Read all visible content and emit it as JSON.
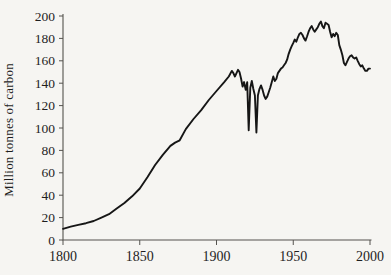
{
  "figure": {
    "background": "#f6f5f2",
    "axis_color": "#55534f",
    "line_color": "#161616",
    "text_color": "#1e1e1e"
  },
  "chart_data": {
    "type": "line",
    "title": "",
    "xlabel": "",
    "ylabel": "Million tonnes of carbon",
    "xlim": [
      1800,
      2000
    ],
    "ylim": [
      0,
      200
    ],
    "x_ticks": [
      "1800",
      "1850",
      "1900",
      "1950",
      "2000"
    ],
    "x_tick_values": [
      1800,
      1850,
      1900,
      1950,
      2000
    ],
    "y_ticks": [
      "0",
      "20",
      "40",
      "60",
      "80",
      "100",
      "120",
      "140",
      "160",
      "180",
      "200"
    ],
    "y_tick_values": [
      0,
      20,
      40,
      60,
      80,
      100,
      120,
      140,
      160,
      180,
      200
    ],
    "grid": false,
    "legend": null,
    "points": [
      [
        1800,
        10
      ],
      [
        1805,
        12
      ],
      [
        1810,
        13.5
      ],
      [
        1815,
        15
      ],
      [
        1820,
        17
      ],
      [
        1825,
        20
      ],
      [
        1830,
        23
      ],
      [
        1835,
        28
      ],
      [
        1840,
        33
      ],
      [
        1845,
        39
      ],
      [
        1850,
        46
      ],
      [
        1855,
        56
      ],
      [
        1860,
        67
      ],
      [
        1865,
        76
      ],
      [
        1870,
        84
      ],
      [
        1873,
        87
      ],
      [
        1876,
        89
      ],
      [
        1880,
        99
      ],
      [
        1885,
        108
      ],
      [
        1890,
        116
      ],
      [
        1895,
        125
      ],
      [
        1900,
        133
      ],
      [
        1905,
        141
      ],
      [
        1908,
        146
      ],
      [
        1910,
        151
      ],
      [
        1911,
        149
      ],
      [
        1912,
        146
      ],
      [
        1913,
        149
      ],
      [
        1914,
        152
      ],
      [
        1915,
        150
      ],
      [
        1916,
        144
      ],
      [
        1917,
        137
      ],
      [
        1918,
        141
      ],
      [
        1919,
        134
      ],
      [
        1920,
        141
      ],
      [
        1921,
        98
      ],
      [
        1922,
        136
      ],
      [
        1923,
        142
      ],
      [
        1924,
        135
      ],
      [
        1925,
        129
      ],
      [
        1926,
        96
      ],
      [
        1927,
        129
      ],
      [
        1928,
        135
      ],
      [
        1929,
        138
      ],
      [
        1930,
        134
      ],
      [
        1931,
        129
      ],
      [
        1932,
        126
      ],
      [
        1933,
        128
      ],
      [
        1934,
        132
      ],
      [
        1935,
        136
      ],
      [
        1936,
        141
      ],
      [
        1937,
        146
      ],
      [
        1938,
        142
      ],
      [
        1939,
        144
      ],
      [
        1940,
        149
      ],
      [
        1941,
        151
      ],
      [
        1942,
        153
      ],
      [
        1943,
        154
      ],
      [
        1944,
        156
      ],
      [
        1945,
        158
      ],
      [
        1946,
        161
      ],
      [
        1947,
        166
      ],
      [
        1948,
        170
      ],
      [
        1949,
        173
      ],
      [
        1950,
        176
      ],
      [
        1951,
        179
      ],
      [
        1952,
        177
      ],
      [
        1953,
        181
      ],
      [
        1954,
        184
      ],
      [
        1955,
        185
      ],
      [
        1956,
        183
      ],
      [
        1957,
        180
      ],
      [
        1958,
        178
      ],
      [
        1959,
        182
      ],
      [
        1960,
        186
      ],
      [
        1961,
        189
      ],
      [
        1962,
        191
      ],
      [
        1963,
        188
      ],
      [
        1964,
        186
      ],
      [
        1965,
        188
      ],
      [
        1966,
        190
      ],
      [
        1967,
        193
      ],
      [
        1968,
        195
      ],
      [
        1969,
        191
      ],
      [
        1970,
        189
      ],
      [
        1971,
        194
      ],
      [
        1972,
        193
      ],
      [
        1973,
        192
      ],
      [
        1974,
        186
      ],
      [
        1975,
        181
      ],
      [
        1976,
        184
      ],
      [
        1977,
        182
      ],
      [
        1978,
        185
      ],
      [
        1979,
        183
      ],
      [
        1980,
        174
      ],
      [
        1981,
        170
      ],
      [
        1982,
        165
      ],
      [
        1983,
        158
      ],
      [
        1984,
        156
      ],
      [
        1985,
        159
      ],
      [
        1986,
        162
      ],
      [
        1987,
        164
      ],
      [
        1988,
        165
      ],
      [
        1989,
        163
      ],
      [
        1990,
        162
      ],
      [
        1991,
        163
      ],
      [
        1992,
        160
      ],
      [
        1993,
        157
      ],
      [
        1994,
        155
      ],
      [
        1995,
        156
      ],
      [
        1996,
        153
      ],
      [
        1997,
        151
      ],
      [
        1998,
        151
      ],
      [
        1999,
        153
      ],
      [
        2000,
        153
      ]
    ]
  }
}
